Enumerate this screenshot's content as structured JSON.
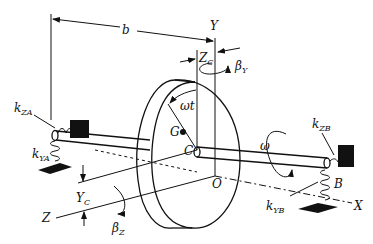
{
  "diagram": {
    "labels": {
      "b": "b",
      "Y": "Y",
      "Z_C": "Z",
      "Z_C_sub": "C",
      "beta_Y": "β",
      "beta_Y_sub": "Y",
      "k_ZA": "k",
      "k_ZA_sub": "ZA",
      "k_YA": "k",
      "k_YA_sub": "YA",
      "omega_t": "ωt",
      "G": "G",
      "C": "C",
      "omega": "ω",
      "O": "O",
      "k_ZB": "k",
      "k_ZB_sub": "ZB",
      "k_YB": "k",
      "k_YB_sub": "YB",
      "B": "B",
      "X": "X",
      "Y_C": "Y",
      "Y_C_sub": "C",
      "Z": "Z",
      "beta_Z": "β",
      "beta_Z_sub": "Z"
    }
  }
}
